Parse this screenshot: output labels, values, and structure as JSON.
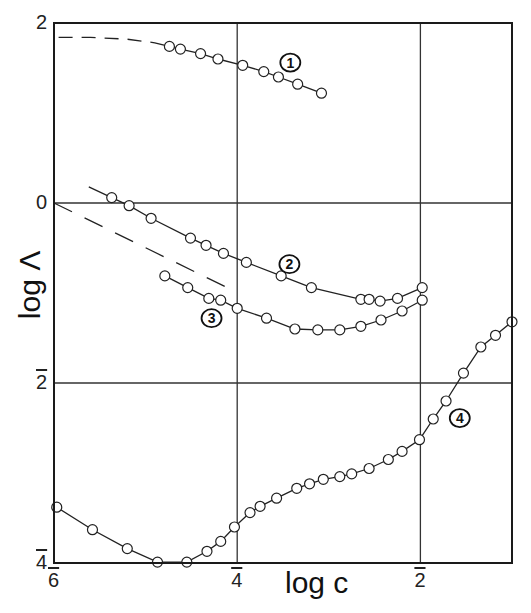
{
  "chart_data": {
    "type": "line",
    "title": "",
    "xlabel": "log c",
    "ylabel": "log Λ",
    "xlim": [
      -6,
      -1
    ],
    "ylim": [
      -4,
      2
    ],
    "grid": true,
    "gridlines_x": [
      -4,
      -2
    ],
    "gridlines_y": [
      0,
      -2
    ],
    "x_ticks": [
      {
        "value": -6,
        "label": "6",
        "bar": true
      },
      {
        "value": -4,
        "label": "4",
        "bar": true
      },
      {
        "value": -2,
        "label": "2",
        "bar": true
      }
    ],
    "y_ticks": [
      {
        "value": 2,
        "label": "2",
        "bar": false
      },
      {
        "value": 0,
        "label": "0",
        "bar": false
      },
      {
        "value": -2,
        "label": "2",
        "bar": true
      },
      {
        "value": -4,
        "label": "4",
        "bar": true
      }
    ],
    "series": [
      {
        "name": "1",
        "marker": "open-circle",
        "x": [
          -4.74,
          -4.62,
          -4.4,
          -4.21,
          -3.94,
          -3.71,
          -3.55,
          -3.34,
          -3.08
        ],
        "y": [
          1.74,
          1.71,
          1.66,
          1.6,
          1.53,
          1.46,
          1.4,
          1.32,
          1.22
        ],
        "extrapolation": {
          "style": "dashed",
          "x": [
            -5.95,
            -5.6,
            -5.2,
            -4.9,
            -4.74
          ],
          "y": [
            1.84,
            1.84,
            1.82,
            1.78,
            1.74
          ]
        },
        "label_pos": {
          "x": -3.42,
          "y": 1.56
        }
      },
      {
        "name": "2",
        "marker": "open-circle",
        "line_start": {
          "x": -5.62,
          "y": 0.18
        },
        "x": [
          -5.37,
          -5.18,
          -4.94,
          -4.51,
          -4.34,
          -4.15,
          -3.9,
          -3.52,
          -3.19,
          -2.65,
          -2.56,
          -2.44,
          -2.25,
          -1.98
        ],
        "y": [
          0.06,
          -0.03,
          -0.17,
          -0.39,
          -0.47,
          -0.56,
          -0.66,
          -0.81,
          -0.94,
          -1.07,
          -1.07,
          -1.09,
          -1.06,
          -0.94
        ],
        "label_pos": {
          "x": -3.43,
          "y": -0.68
        }
      },
      {
        "name": "3",
        "marker": "open-circle",
        "x": [
          -4.79,
          -4.54,
          -4.31,
          -4.18,
          -4.0,
          -3.68,
          -3.37,
          -3.12,
          -2.88,
          -2.65,
          -2.43,
          -2.2,
          -1.98
        ],
        "y": [
          -0.81,
          -0.94,
          -1.06,
          -1.08,
          -1.17,
          -1.28,
          -1.4,
          -1.41,
          -1.41,
          -1.37,
          -1.3,
          -1.2,
          -1.08
        ],
        "label_pos": {
          "x": -4.28,
          "y": -1.28
        }
      },
      {
        "name": "dashed reference",
        "style": "dashed",
        "marker": "none",
        "x": [
          -6.0,
          -4.03
        ],
        "y": [
          0.0,
          -0.98
        ]
      },
      {
        "name": "4",
        "marker": "open-circle",
        "x": [
          -5.97,
          -5.58,
          -5.2,
          -4.87,
          -4.55,
          -4.33,
          -4.18,
          -4.03,
          -3.86,
          -3.75,
          -3.57,
          -3.35,
          -3.21,
          -3.06,
          -2.88,
          -2.75,
          -2.56,
          -2.35,
          -2.2,
          -2.01,
          -1.86,
          -1.72,
          -1.53,
          -1.34,
          -1.18,
          -1.0
        ],
        "y": [
          -3.38,
          -3.63,
          -3.84,
          -3.99,
          -3.99,
          -3.87,
          -3.76,
          -3.6,
          -3.44,
          -3.37,
          -3.28,
          -3.17,
          -3.12,
          -3.07,
          -3.04,
          -3.01,
          -2.95,
          -2.85,
          -2.76,
          -2.63,
          -2.4,
          -2.2,
          -1.89,
          -1.6,
          -1.47,
          -1.32
        ],
        "label_pos": {
          "x": -1.57,
          "y": -2.39
        }
      }
    ]
  },
  "axes": {
    "xlabel": "log c",
    "ylabel": "log Λ"
  }
}
